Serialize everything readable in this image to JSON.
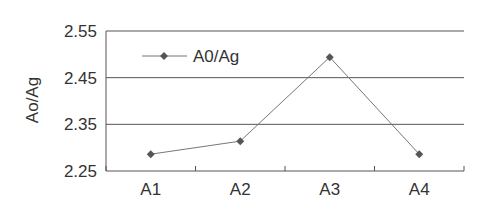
{
  "chart_data": {
    "type": "line",
    "title": "",
    "xlabel": "",
    "ylabel": "Ao/Ag",
    "categories": [
      "A1",
      "A2",
      "A3",
      "A4"
    ],
    "series": [
      {
        "name": "A0/Ag",
        "values": [
          2.286,
          2.314,
          2.494,
          2.286
        ],
        "color": "#555555",
        "marker": "diamond"
      }
    ],
    "yticks": [
      "2.25",
      "2.35",
      "2.45",
      "2.55"
    ],
    "ylim": [
      2.25,
      2.55
    ],
    "grid": {
      "horizontal": true,
      "vertical": false
    },
    "legend_position": "upper-left inside"
  },
  "colors": {
    "gridline": "#555555",
    "line": "#777777",
    "marker": "#555555",
    "text": "#333333"
  }
}
